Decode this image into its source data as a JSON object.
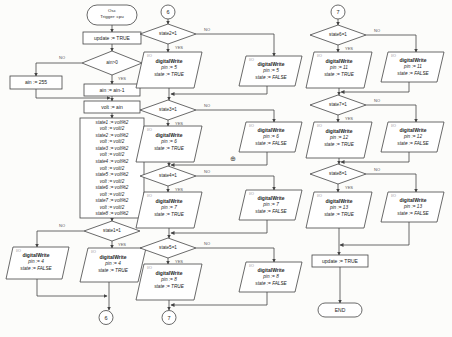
{
  "colors": {
    "background": "#fcfcfa",
    "stroke": "#444444"
  },
  "labels": {
    "yes": "YES",
    "no": "NO",
    "io_tag": "I/O",
    "cross": "⊕"
  },
  "start": {
    "line1": "Osc",
    "line2": "Trigger: cpu"
  },
  "process": {
    "update_top": "update := TRUE",
    "ain_reset": "ain := 255",
    "ain_dec": "ain := ain-1",
    "volt_assign": "volt := ain",
    "update_bottom": "update := TRUE"
  },
  "bit_extract": [
    "state1 := volt%2",
    "volt := volt/2",
    "state2 := volt%2",
    "volt := volt/2",
    "state3 := volt%2",
    "volt := volt/2",
    "state4 := volt%2",
    "volt := volt/2",
    "state5 := volt%2",
    "volt := volt/2",
    "state6 := volt%2",
    "volt := volt/2",
    "state7 := volt%2",
    "volt := volt/2",
    "state8 := volt%2"
  ],
  "decisions": {
    "ain": "ain>0",
    "s1": "state1=1",
    "s2": "state2=1",
    "s3": "state3=1",
    "s4": "state4=1",
    "s5": "state5=1",
    "s6": "state6=1",
    "s7": "state7=1",
    "s8": "state8=1"
  },
  "connectors": {
    "c6": "6",
    "c7": "7"
  },
  "end": "END",
  "io_fn": "digitalWrite",
  "outputs": {
    "p4t": {
      "pin": "pin := 4",
      "state": "state := TRUE"
    },
    "p4f": {
      "pin": "pin := 4",
      "state": "state := FALSE"
    },
    "p5t": {
      "pin": "pin := 5",
      "state": "state := TRUE"
    },
    "p5f": {
      "pin": "pin := 5",
      "state": "state := FALSE"
    },
    "p6t": {
      "pin": "pin := 6",
      "state": "state := TRUE"
    },
    "p6f": {
      "pin": "pin := 6",
      "state": "state := FALSE"
    },
    "p7t": {
      "pin": "pin := 7",
      "state": "state := TRUE"
    },
    "p7f": {
      "pin": "pin := 7",
      "state": "state := FALSE"
    },
    "p8t": {
      "pin": "pin := 8",
      "state": "state := TRUE"
    },
    "p8f": {
      "pin": "pin := 8",
      "state": "state := FALSE"
    },
    "p11t": {
      "pin": "pin := 11",
      "state": "state := TRUE"
    },
    "p11f": {
      "pin": "pin := 11",
      "state": "state := FALSE"
    },
    "p12t": {
      "pin": "pin := 12",
      "state": "state := TRUE"
    },
    "p12f": {
      "pin": "pin := 12",
      "state": "state := FALSE"
    },
    "p13t": {
      "pin": "pin := 13",
      "state": "state := TRUE"
    },
    "p13f": {
      "pin": "pin := 13",
      "state": "state := FALSE"
    }
  }
}
